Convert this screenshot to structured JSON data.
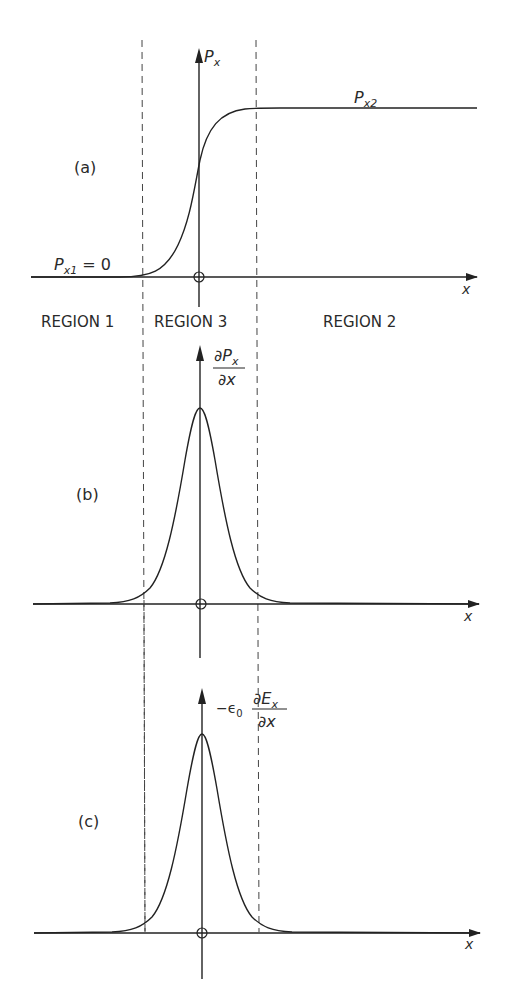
{
  "regions": [
    {
      "id": "region-1",
      "label": "REGION 1"
    },
    {
      "id": "region-3",
      "label": "REGION 3"
    },
    {
      "id": "region-2",
      "label": "REGION 2"
    }
  ],
  "panels": {
    "a": {
      "tag": "(a)",
      "y_label": "P",
      "y_label_sub": "x",
      "x_label": "x",
      "left_value": {
        "main": "P",
        "sub": "x1",
        "rest": " = 0"
      },
      "right_value": {
        "main": "P",
        "sub": "x2"
      }
    },
    "b": {
      "tag": "(b)",
      "y_label_num": "∂P",
      "y_label_num_sub": "x",
      "y_label_den": "∂x",
      "x_label": "x"
    },
    "c": {
      "tag": "(c)",
      "y_label_prefix": "−ϵ",
      "y_label_prefix_sub": "0",
      "y_label_num": "∂E",
      "y_label_num_sub": "x",
      "y_label_den": "∂x",
      "x_label": "x"
    }
  },
  "colors": {
    "ink": "#222222",
    "background": "#ffffff"
  }
}
